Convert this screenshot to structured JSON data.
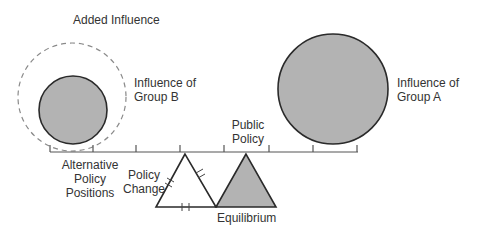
{
  "diagram": {
    "labels": {
      "added_influence": "Added Influence",
      "influence_b_line1": "Influence of",
      "influence_b_line2": "Group B",
      "influence_a_line1": "Influence of",
      "influence_a_line2": "Group A",
      "public_policy_line1": "Public",
      "public_policy_line2": "Policy",
      "alternative_line1": "Alternative",
      "alternative_line2": "Policy",
      "alternative_line3": "Positions",
      "policy_change_line1": "Policy",
      "policy_change_line2": "Change",
      "equilibrium": "Equilibrium"
    },
    "colors": {
      "fill_gray": "#b3b3b3",
      "stroke": "#2a2a2a",
      "dashed": "#888888"
    },
    "elements": [
      {
        "id": "group-b-circle",
        "shape": "circle",
        "fill": "gray"
      },
      {
        "id": "added-influence-circle",
        "shape": "circle",
        "style": "dashed"
      },
      {
        "id": "group-a-circle",
        "shape": "circle",
        "fill": "gray"
      },
      {
        "id": "policy-beam",
        "shape": "line",
        "ticks": 8
      },
      {
        "id": "policy-change-fulcrum",
        "shape": "triangle",
        "fill": "white"
      },
      {
        "id": "equilibrium-fulcrum",
        "shape": "triangle",
        "fill": "gray"
      }
    ]
  }
}
